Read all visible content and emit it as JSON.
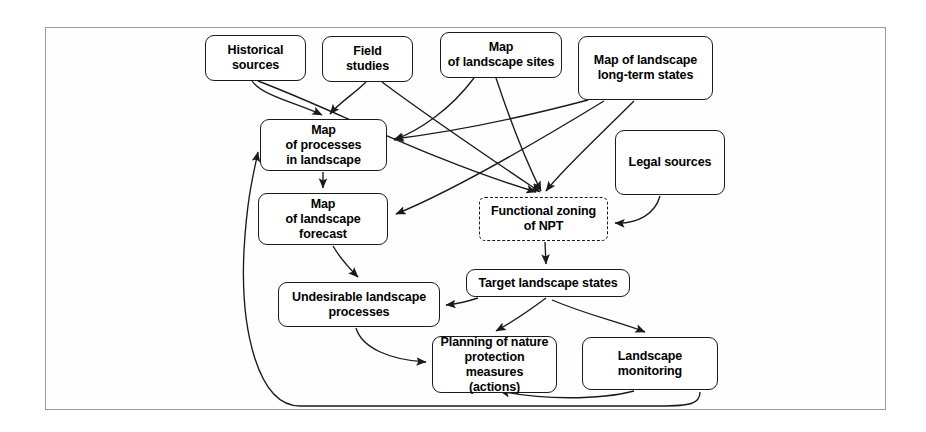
{
  "figure": {
    "frame": {
      "border_color": "#9a9a9a"
    },
    "node_border_color": "#1a1a1a",
    "edge_color": "#1a1a1a",
    "background": "#ffffff"
  },
  "nodes": [
    {
      "id": "historical-sources",
      "label": "Historical\nsources",
      "style": "solid",
      "x": 205,
      "y": 35,
      "w": 101,
      "h": 46
    },
    {
      "id": "field-studies",
      "label": "Field\nstudies",
      "style": "solid",
      "x": 322,
      "y": 36,
      "w": 91,
      "h": 46
    },
    {
      "id": "map-landscape-sites",
      "label": "Map\nof landscape sites",
      "style": "solid",
      "x": 440,
      "y": 32,
      "w": 122,
      "h": 46
    },
    {
      "id": "map-landscape-long-term",
      "label": "Map of landscape\nlong-term states",
      "style": "solid",
      "x": 578,
      "y": 36,
      "w": 135,
      "h": 64
    },
    {
      "id": "legal-sources",
      "label": "Legal sources",
      "style": "solid",
      "x": 615,
      "y": 130,
      "w": 110,
      "h": 65
    },
    {
      "id": "map-processes-landscape",
      "label": "Map\nof processes\nin landscape",
      "style": "solid",
      "x": 260,
      "y": 119,
      "w": 127,
      "h": 52
    },
    {
      "id": "map-landscape-forecast",
      "label": "Map\nof landscape\nforecast",
      "style": "solid",
      "x": 258,
      "y": 193,
      "w": 130,
      "h": 52
    },
    {
      "id": "functional-zoning-npt",
      "label": "Functional zoning\nof NPT",
      "style": "dashed",
      "x": 479,
      "y": 197,
      "w": 129,
      "h": 44
    },
    {
      "id": "target-landscape-states",
      "label": "Target landscape states",
      "style": "solid",
      "x": 466,
      "y": 269,
      "w": 164,
      "h": 28
    },
    {
      "id": "undesirable-processes",
      "label": "Undesirable landscape\nprocesses",
      "style": "solid",
      "x": 278,
      "y": 282,
      "w": 162,
      "h": 45
    },
    {
      "id": "planning-nature-measures",
      "label": "Planning of nature\nprotection measures\n(actions)",
      "style": "solid",
      "x": 432,
      "y": 336,
      "w": 125,
      "h": 57
    },
    {
      "id": "landscape-monitoring",
      "label": "Landscape\nmonitoring",
      "style": "solid",
      "x": 582,
      "y": 337,
      "w": 136,
      "h": 53
    }
  ],
  "edges": [
    {
      "id": "historical-to-map-processes",
      "from": "historical-sources",
      "to": "map-processes-landscape"
    },
    {
      "id": "historical-to-functional-zoning",
      "from": "historical-sources",
      "to": "functional-zoning-npt"
    },
    {
      "id": "field-studies-to-map-processes",
      "from": "field-studies",
      "to": "map-processes-landscape"
    },
    {
      "id": "field-studies-to-functional-zoning",
      "from": "field-studies",
      "to": "functional-zoning-npt"
    },
    {
      "id": "sites-to-map-processes",
      "from": "map-landscape-sites",
      "to": "map-processes-landscape"
    },
    {
      "id": "sites-to-functional-zoning",
      "from": "map-landscape-sites",
      "to": "functional-zoning-npt"
    },
    {
      "id": "long-term-to-map-processes",
      "from": "map-landscape-long-term",
      "to": "map-processes-landscape"
    },
    {
      "id": "long-term-to-forecast",
      "from": "map-landscape-long-term",
      "to": "map-landscape-forecast"
    },
    {
      "id": "long-term-to-functional-zoning",
      "from": "map-landscape-long-term",
      "to": "functional-zoning-npt"
    },
    {
      "id": "legal-to-functional-zoning",
      "from": "legal-sources",
      "to": "functional-zoning-npt"
    },
    {
      "id": "map-processes-to-forecast",
      "from": "map-processes-landscape",
      "to": "map-landscape-forecast"
    },
    {
      "id": "forecast-to-undesirable",
      "from": "map-landscape-forecast",
      "to": "undesirable-processes"
    },
    {
      "id": "zoning-to-target-states",
      "from": "functional-zoning-npt",
      "to": "target-landscape-states"
    },
    {
      "id": "target-to-undesirable",
      "from": "target-landscape-states",
      "to": "undesirable-processes"
    },
    {
      "id": "target-to-planning",
      "from": "target-landscape-states",
      "to": "planning-nature-measures"
    },
    {
      "id": "target-to-monitoring",
      "from": "target-landscape-states",
      "to": "landscape-monitoring"
    },
    {
      "id": "undesirable-to-planning",
      "from": "undesirable-processes",
      "to": "planning-nature-measures"
    },
    {
      "id": "monitoring-to-planning",
      "from": "landscape-monitoring",
      "to": "planning-nature-measures"
    },
    {
      "id": "monitoring-to-map-processes",
      "from": "landscape-monitoring",
      "to": "map-processes-landscape"
    }
  ]
}
